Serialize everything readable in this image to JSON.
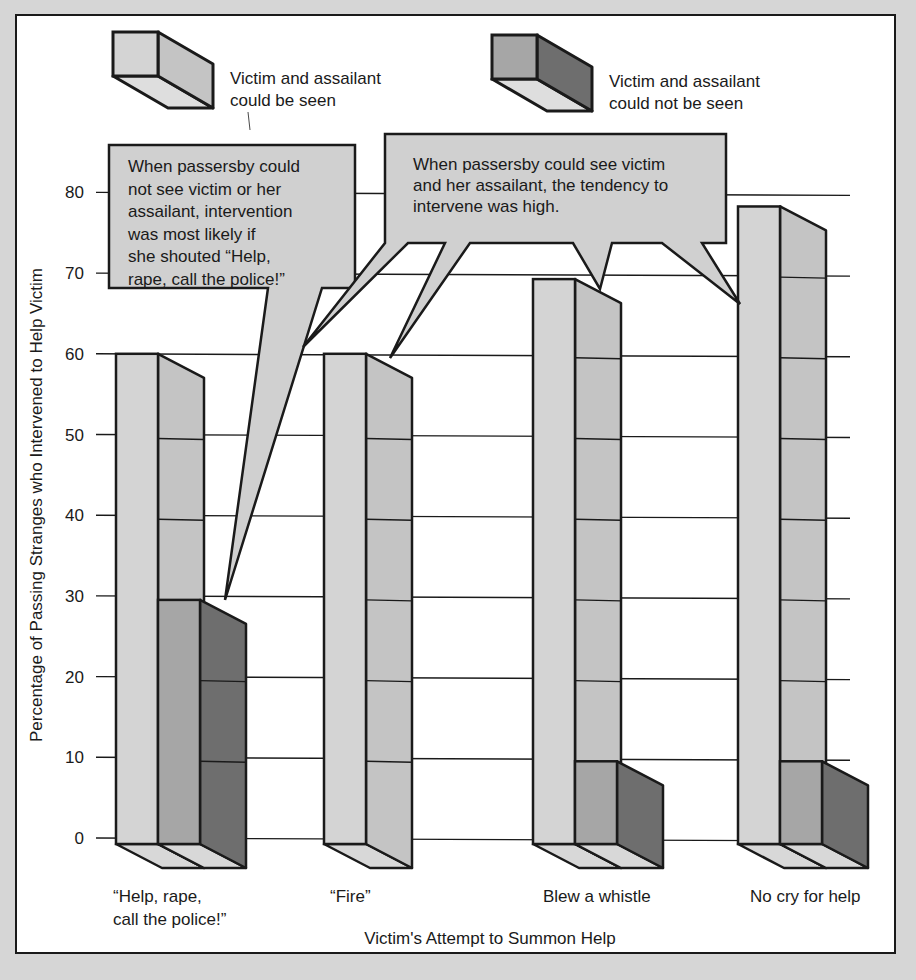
{
  "chart_data": {
    "type": "bar",
    "style": "3d-grouped",
    "title": "",
    "xlabel": "Victim's Attempt to Summon Help",
    "ylabel": "Percentage of Passing Stranges who Intervened to Help Victim",
    "ylim": [
      0,
      80
    ],
    "yticks": [
      0,
      10,
      20,
      30,
      40,
      50,
      60,
      70,
      80
    ],
    "grid": true,
    "categories": [
      [
        "“Help, rape,",
        "call the police!”"
      ],
      [
        "“Fire”"
      ],
      [
        "Blew a whistle"
      ],
      [
        "No cry for help"
      ]
    ],
    "series": [
      {
        "name": "Victim and assailant could be seen",
        "color": "#d4d4d4",
        "side_color": "#c4c4c4",
        "values": [
          60,
          60,
          70,
          79
        ]
      },
      {
        "name": "Victim and assailant could not be seen",
        "color": "#a6a6a6",
        "side_color": "#6e6e6e",
        "values": [
          30,
          0,
          10,
          10
        ]
      }
    ],
    "legend": {
      "placement": "top",
      "items": [
        {
          "lines": [
            "Victim and  assailant",
            "could be seen"
          ]
        },
        {
          "lines": [
            "Victim and  assailant",
            "could not  be seen"
          ]
        }
      ]
    },
    "annotations": [
      {
        "id": "callout-not-seen",
        "lines": [
          "When passersby could",
          "not see victim or her",
          "assailant, intervention",
          "was most likely if",
          "she shouted “Help,",
          "rape, call the police!”"
        ]
      },
      {
        "id": "callout-seen",
        "lines": [
          "When passersby could see victim",
          "and her assailant, the tendency to",
          "intervene was high."
        ]
      }
    ]
  },
  "colors": {
    "page_background": "#d6d6d6",
    "panel": "#ffffff",
    "ink": "#1a1a1a",
    "callout_fill": "#d0d0d0"
  }
}
